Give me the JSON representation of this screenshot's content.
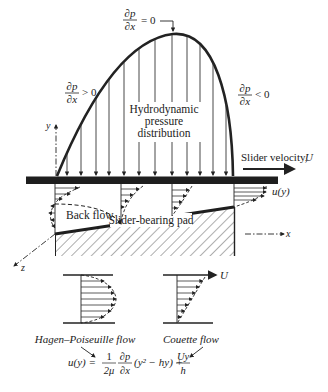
{
  "labels": {
    "dpdx_zero": {
      "num": "∂p",
      "den": "∂x",
      "rel": "= 0"
    },
    "dpdx_pos": {
      "num": "∂p",
      "den": "∂x",
      "rel": "> 0"
    },
    "dpdx_neg": {
      "num": "∂p",
      "den": "∂x",
      "rel": "< 0"
    },
    "pressure_line1": "Hydrodynamic",
    "pressure_line2": "pressure",
    "pressure_line3": "distribution",
    "slider_velocity": "Slider velocity, ",
    "slider_velocity_sym": "U",
    "u_of_y": "u(y)",
    "back_flow": "Back flow",
    "pad": "Slider-bearing pad",
    "axis_x": "x",
    "axis_y": "y",
    "axis_z": "z",
    "hp_flow": "Hagen–Poiseuille flow",
    "couette_flow": "Couette flow",
    "couette_U": "U"
  },
  "equation": {
    "lhs": "u(y) =",
    "frac1_num": "1",
    "frac1_den": "2μ",
    "frac2_num": "∂p",
    "frac2_den": "∂x",
    "mid": "(y² − hy) +",
    "frac3_num": "Uy",
    "frac3_den": "h"
  },
  "colors": {
    "ink": "#222222",
    "bar": "#1e1e1e",
    "background": "#ffffff"
  }
}
